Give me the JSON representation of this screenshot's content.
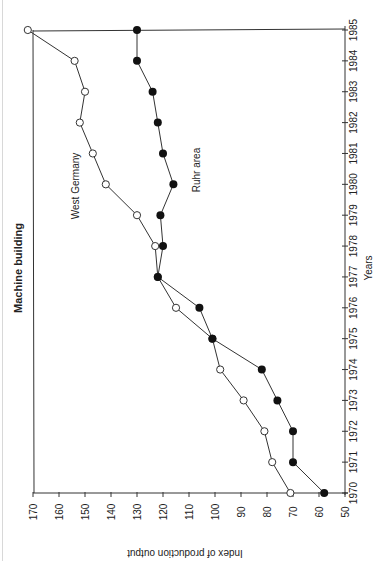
{
  "chart_data": {
    "type": "line",
    "orientation": "rotated-90-ccw",
    "title": "Machine building",
    "xlabel": "Years",
    "ylabel": "Index of production output",
    "x": [
      1970,
      1971,
      1972,
      1973,
      1974,
      1975,
      1976,
      1977,
      1978,
      1979,
      1980,
      1981,
      1982,
      1983,
      1984,
      1985
    ],
    "x_ticks": [
      "1970",
      "1971",
      "1972",
      "1973",
      "1974",
      "1975",
      "1976",
      "1977",
      "1978",
      "1979",
      "1980",
      "1981",
      "1982",
      "1983",
      "1984",
      "1985"
    ],
    "y_ticks": [
      "50",
      "60",
      "70",
      "80",
      "90",
      "100",
      "110",
      "120",
      "130",
      "140",
      "150",
      "160",
      "170"
    ],
    "xlim": [
      1970,
      1985
    ],
    "ylim": [
      50,
      170
    ],
    "grid": false,
    "legend": "inline labels",
    "series": [
      {
        "name": "West Germany",
        "marker": "open-circle",
        "values": [
          71,
          78,
          81,
          89,
          98,
          101,
          115,
          122,
          123,
          130,
          142,
          147,
          152,
          150,
          154,
          172
        ]
      },
      {
        "name": "Ruhr area",
        "marker": "filled-circle",
        "values": [
          58,
          70,
          70,
          76,
          82,
          101,
          106,
          122,
          120,
          121,
          116,
          120,
          122,
          124,
          130,
          130
        ]
      }
    ],
    "annotations": [
      {
        "text": "West Germany",
        "near_year": 1980
      },
      {
        "text": "Ruhr area",
        "near_year": 1981
      }
    ]
  },
  "colors": {
    "line": "#333333",
    "marker_fill": "#111111",
    "background": "#ffffff"
  }
}
